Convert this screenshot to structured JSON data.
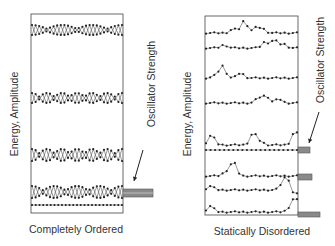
{
  "panels": [
    {
      "id": "ordered",
      "caption": "Completely Ordered",
      "y_axis_label": "Energy, Amplitude",
      "side_label": "Oscillator Strength",
      "box": {
        "x": 31,
        "y": 14,
        "w": 92,
        "h": 199
      },
      "states": [
        {
          "type": "standing-wave",
          "y": 30,
          "amp": 5,
          "nodes": 3,
          "period": 8
        },
        {
          "type": "standing-wave",
          "y": 98,
          "amp": 5,
          "nodes": 6,
          "period": 8
        },
        {
          "type": "standing-wave",
          "y": 155,
          "amp": 6,
          "nodes": 6,
          "period": 12
        },
        {
          "type": "standing-wave",
          "y": 192,
          "amp": 6,
          "nodes": 4,
          "period": 24
        },
        {
          "type": "flat",
          "y": 205
        }
      ],
      "oscillator_bars": [
        {
          "y": 189,
          "h": 8,
          "length": 30
        }
      ],
      "arrow": {
        "x1": 143,
        "y1": 150,
        "x2": 134,
        "y2": 181
      }
    },
    {
      "id": "disordered",
      "caption": "Statically Disordered",
      "y_axis_label": "Energy, Amplitude",
      "side_label": "Oscillator Strength",
      "box": {
        "x": 205,
        "y": 16,
        "w": 93,
        "h": 199
      },
      "states": [
        {
          "type": "localized",
          "y": 33,
          "peaks": [
            [
              0.42,
              12
            ],
            [
              0.3,
              4
            ],
            [
              0.55,
              5
            ],
            [
              0.62,
              4
            ]
          ]
        },
        {
          "type": "localized",
          "y": 48,
          "peaks": [
            [
              0.65,
              6
            ],
            [
              0.75,
              8
            ],
            [
              0.85,
              4
            ],
            [
              0.2,
              3
            ]
          ]
        },
        {
          "type": "localized",
          "y": 78,
          "peaks": [
            [
              0.18,
              12
            ],
            [
              0.38,
              5
            ],
            [
              0.1,
              2
            ]
          ]
        },
        {
          "type": "localized",
          "y": 103,
          "peaks": [
            [
              0.58,
              5
            ],
            [
              0.66,
              7
            ],
            [
              0.8,
              4
            ]
          ]
        },
        {
          "type": "localized",
          "y": 145,
          "peaks": [
            [
              0.06,
              10
            ],
            [
              0.52,
              12
            ],
            [
              0.98,
              14
            ],
            [
              0.6,
              3
            ]
          ]
        },
        {
          "type": "flat-dotted",
          "y": 150
        },
        {
          "type": "localized",
          "y": 176,
          "peaks": [
            [
              0.3,
              14
            ],
            [
              0.22,
              4
            ]
          ]
        },
        {
          "type": "localized",
          "y": 190,
          "peaks": [
            [
              0.05,
              4
            ],
            [
              0.85,
              7
            ],
            [
              0.9,
              10
            ],
            [
              0.97,
              -6
            ]
          ]
        },
        {
          "type": "localized",
          "y": 212,
          "peaks": [
            [
              0.05,
              6
            ],
            [
              0.98,
              14
            ],
            [
              0.92,
              3
            ]
          ]
        }
      ],
      "oscillator_bars": [
        {
          "y": 147,
          "h": 6,
          "length": 12
        },
        {
          "y": 174,
          "h": 6,
          "length": 14
        },
        {
          "y": 212,
          "h": 5,
          "length": 22
        }
      ],
      "arrow": {
        "x1": 319,
        "y1": 112,
        "x2": 309,
        "y2": 143
      }
    }
  ],
  "colors": {
    "line": "#555555",
    "dot": "#222222",
    "box": "#444444",
    "bar_fill": "#8a8a8a",
    "bar_stroke": "#555555",
    "text": "#333333"
  }
}
